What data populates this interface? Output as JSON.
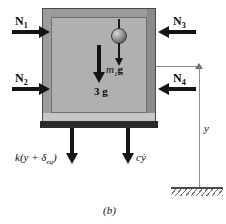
{
  "figure": {
    "caption": "(b)"
  },
  "forces": {
    "normal_top_left": {
      "symbol": "N",
      "subscript": "1",
      "direction": "right"
    },
    "normal_bottom_left": {
      "symbol": "N",
      "subscript": "2",
      "direction": "right"
    },
    "normal_top_right": {
      "symbol": "N",
      "subscript": "3",
      "direction": "left"
    },
    "normal_bottom_right": {
      "symbol": "N",
      "subscript": "4",
      "direction": "left"
    },
    "bob_weight": {
      "symbol": "m",
      "subscript": "1",
      "unit": "g",
      "direction": "down"
    },
    "body_weight": {
      "text": "3 g",
      "direction": "down"
    },
    "spring_force": {
      "prefix": "k(y + ",
      "delta": "δ",
      "subscript": "eq",
      "suffix": ")",
      "direction": "down"
    },
    "damper_force": {
      "coefficient": "c",
      "variable": "ẏ",
      "direction": "down"
    }
  },
  "dimension": {
    "label": "y",
    "from": "body",
    "to": "ground"
  },
  "ground": {
    "name": "ground-datum"
  }
}
